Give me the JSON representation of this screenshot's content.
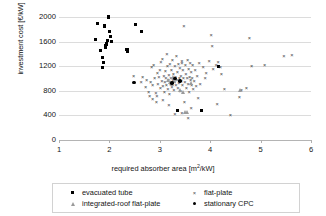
{
  "chart_data": {
    "type": "scatter",
    "title": "",
    "xlabel": "required absorber area [m2/kW]",
    "xlabel_main": "required absorber area [m",
    "xlabel_sup": "2",
    "xlabel_tail": "/kW]",
    "ylabel": "investment cost [€/kW]",
    "xlim": [
      1,
      6
    ],
    "ylim": [
      0,
      2000
    ],
    "xticks": [
      1,
      2,
      3,
      4,
      5,
      6
    ],
    "yticks": [
      0,
      400,
      800,
      1200,
      1600,
      2000
    ],
    "grid": "horizontal",
    "legend_position": "below-axis",
    "series": [
      {
        "name": "evacuated tube",
        "marker": "square",
        "color": "#000000",
        "points": [
          [
            1.73,
            1640
          ],
          [
            1.77,
            1900
          ],
          [
            1.83,
            1460
          ],
          [
            1.86,
            1345
          ],
          [
            1.88,
            1255
          ],
          [
            1.86,
            1175
          ],
          [
            1.9,
            1855
          ],
          [
            1.92,
            1540
          ],
          [
            1.93,
            1510
          ],
          [
            1.95,
            1560
          ],
          [
            1.97,
            1620
          ],
          [
            1.99,
            2000
          ],
          [
            2.0,
            1760
          ],
          [
            2.02,
            1680
          ],
          [
            2.04,
            1605
          ],
          [
            2.35,
            1470
          ],
          [
            2.36,
            1435
          ],
          [
            2.52,
            1880
          ],
          [
            2.63,
            1765
          ],
          [
            3.82,
            475
          ],
          [
            3.35,
            480
          ],
          [
            4.17,
            1195
          ]
        ]
      },
      {
        "name": "flat-plate",
        "marker": "cross",
        "color": "#3d3d3d",
        "points": [
          [
            2.48,
            1035
          ],
          [
            2.63,
            935
          ],
          [
            2.66,
            1010
          ],
          [
            2.72,
            860
          ],
          [
            2.74,
            960
          ],
          [
            2.78,
            780
          ],
          [
            2.8,
            700
          ],
          [
            2.82,
            935
          ],
          [
            2.84,
            1180
          ],
          [
            2.86,
            880
          ],
          [
            2.88,
            1210
          ],
          [
            2.9,
            1000
          ],
          [
            2.92,
            760
          ],
          [
            2.93,
            610
          ],
          [
            2.95,
            1075
          ],
          [
            2.96,
            905
          ],
          [
            2.98,
            1015
          ],
          [
            3.0,
            1135
          ],
          [
            3.01,
            845
          ],
          [
            3.02,
            1255
          ],
          [
            3.04,
            955
          ],
          [
            3.05,
            1315
          ],
          [
            3.06,
            870
          ],
          [
            3.08,
            1025
          ],
          [
            3.09,
            770
          ],
          [
            3.1,
            940
          ],
          [
            3.11,
            1110
          ],
          [
            3.12,
            1000
          ],
          [
            3.13,
            885
          ],
          [
            3.14,
            1390
          ],
          [
            3.15,
            1190
          ],
          [
            3.16,
            820
          ],
          [
            3.17,
            960
          ],
          [
            3.18,
            1050
          ],
          [
            3.19,
            735
          ],
          [
            3.2,
            1230
          ],
          [
            3.21,
            900
          ],
          [
            3.22,
            1000
          ],
          [
            3.23,
            1130
          ],
          [
            3.24,
            860
          ],
          [
            3.25,
            1295
          ],
          [
            3.26,
            960
          ],
          [
            3.27,
            1060
          ],
          [
            3.28,
            800
          ],
          [
            3.29,
            935
          ],
          [
            3.3,
            1190
          ],
          [
            3.31,
            1010
          ],
          [
            3.32,
            880
          ],
          [
            3.33,
            1355
          ],
          [
            3.34,
            965
          ],
          [
            3.35,
            1100
          ],
          [
            3.36,
            845
          ],
          [
            3.37,
            1235
          ],
          [
            3.38,
            920
          ],
          [
            3.39,
            1000
          ],
          [
            3.4,
            1160
          ],
          [
            3.41,
            790
          ],
          [
            3.42,
            1040
          ],
          [
            3.43,
            955
          ],
          [
            3.44,
            1270
          ],
          [
            3.45,
            880
          ],
          [
            3.46,
            1125
          ],
          [
            3.47,
            1000
          ],
          [
            3.48,
            1840
          ],
          [
            3.49,
            610
          ],
          [
            3.5,
            935
          ],
          [
            3.51,
            1205
          ],
          [
            3.52,
            1060
          ],
          [
            3.53,
            845
          ],
          [
            3.54,
            1000
          ],
          [
            3.55,
            1300
          ],
          [
            3.56,
            910
          ],
          [
            3.57,
            1150
          ],
          [
            3.58,
            765
          ],
          [
            3.59,
            1015
          ],
          [
            3.6,
            1240
          ],
          [
            3.61,
            960
          ],
          [
            3.62,
            1090
          ],
          [
            3.63,
            880
          ],
          [
            3.64,
            1000
          ],
          [
            3.65,
            1215
          ],
          [
            3.66,
            820
          ],
          [
            3.68,
            950
          ],
          [
            3.7,
            1125
          ],
          [
            3.72,
            870
          ],
          [
            3.74,
            1040
          ],
          [
            3.76,
            680
          ],
          [
            3.78,
            1250
          ],
          [
            3.8,
            900
          ],
          [
            3.44,
            430
          ],
          [
            3.56,
            350
          ],
          [
            3.62,
            520
          ],
          [
            3.3,
            415
          ],
          [
            3.18,
            560
          ],
          [
            3.06,
            640
          ],
          [
            2.94,
            700
          ],
          [
            2.86,
            660
          ],
          [
            3.86,
            1180
          ],
          [
            3.92,
            1075
          ],
          [
            3.98,
            1275
          ],
          [
            4.02,
            1700
          ],
          [
            4.04,
            1520
          ],
          [
            4.06,
            1145
          ],
          [
            4.12,
            1210
          ],
          [
            4.16,
            1255
          ],
          [
            4.2,
            1180
          ],
          [
            4.22,
            1060
          ],
          [
            4.28,
            820
          ],
          [
            4.14,
            580
          ],
          [
            4.4,
            395
          ],
          [
            4.58,
            690
          ],
          [
            4.62,
            800
          ],
          [
            4.72,
            840
          ],
          [
            4.78,
            1650
          ],
          [
            4.82,
            1200
          ],
          [
            5.08,
            1215
          ],
          [
            5.46,
            1355
          ],
          [
            5.62,
            1375
          ],
          [
            3.9,
            1000
          ],
          [
            3.44,
            1250
          ]
        ]
      },
      {
        "name": "integrated-roof flat-plate",
        "marker": "triangle",
        "color": "#9a9a9a",
        "points": [
          [
            3.18,
            975
          ],
          [
            3.22,
            940
          ],
          [
            3.26,
            900
          ],
          [
            3.3,
            955
          ],
          [
            3.34,
            985
          ],
          [
            3.42,
            800
          ],
          [
            3.48,
            780
          ],
          [
            3.52,
            445
          ],
          [
            3.56,
            455
          ],
          [
            4.6,
            800
          ],
          [
            3.64,
            920
          ],
          [
            3.28,
            1010
          ]
        ]
      },
      {
        "name": "stationary CPC",
        "marker": "dot",
        "color": "#000000",
        "points": [
          [
            2.49,
            935
          ],
          [
            3.24,
            930
          ],
          [
            3.3,
            1000
          ],
          [
            3.4,
            960
          ]
        ]
      }
    ]
  },
  "legend": {
    "items": [
      {
        "label": "evacuated tube",
        "marker": "square"
      },
      {
        "label": "flat-plate",
        "marker": "cross"
      },
      {
        "label": "integrated-roof flat-plate",
        "marker": "triangle"
      },
      {
        "label": "stationary CPC",
        "marker": "dot"
      }
    ]
  },
  "cross_glyph": "×"
}
